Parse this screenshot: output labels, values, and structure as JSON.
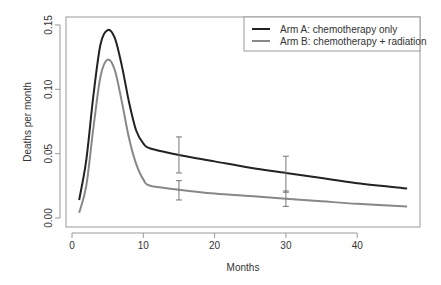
{
  "chart_data": {
    "type": "line",
    "title": "",
    "xlabel": "Months",
    "ylabel": "Deaths per month",
    "xlim": [
      0,
      48
    ],
    "ylim": [
      0,
      0.15
    ],
    "x_ticks": [
      "0",
      "10",
      "20",
      "30",
      "40"
    ],
    "y_ticks": [
      "0.00",
      "0.05",
      "0.10",
      "0.15"
    ],
    "grid": false,
    "legend_position": "top-right",
    "series": [
      {
        "name": "Arm A: chemotherapy only",
        "color": "#222222",
        "x": [
          1,
          2,
          3,
          4,
          5,
          6,
          7,
          8,
          9,
          10,
          11,
          15,
          20,
          25,
          30,
          35,
          40,
          47
        ],
        "values": [
          0.014,
          0.045,
          0.095,
          0.135,
          0.146,
          0.14,
          0.118,
          0.09,
          0.068,
          0.058,
          0.054,
          0.049,
          0.044,
          0.039,
          0.035,
          0.031,
          0.027,
          0.023
        ],
        "error_bars": [
          {
            "x": 15,
            "low": 0.035,
            "high": 0.063
          },
          {
            "x": 30,
            "low": 0.02,
            "high": 0.048
          }
        ]
      },
      {
        "name": "Arm B: chemotherapy + radiation",
        "color": "#888888",
        "x": [
          1,
          2,
          3,
          4,
          5,
          6,
          7,
          8,
          9,
          10,
          11,
          15,
          20,
          25,
          30,
          35,
          40,
          47
        ],
        "values": [
          0.004,
          0.025,
          0.07,
          0.11,
          0.123,
          0.115,
          0.09,
          0.062,
          0.042,
          0.03,
          0.025,
          0.022,
          0.019,
          0.017,
          0.015,
          0.013,
          0.011,
          0.009
        ],
        "error_bars": [
          {
            "x": 15,
            "low": 0.014,
            "high": 0.029
          },
          {
            "x": 30,
            "low": 0.009,
            "high": 0.021
          }
        ]
      }
    ]
  }
}
